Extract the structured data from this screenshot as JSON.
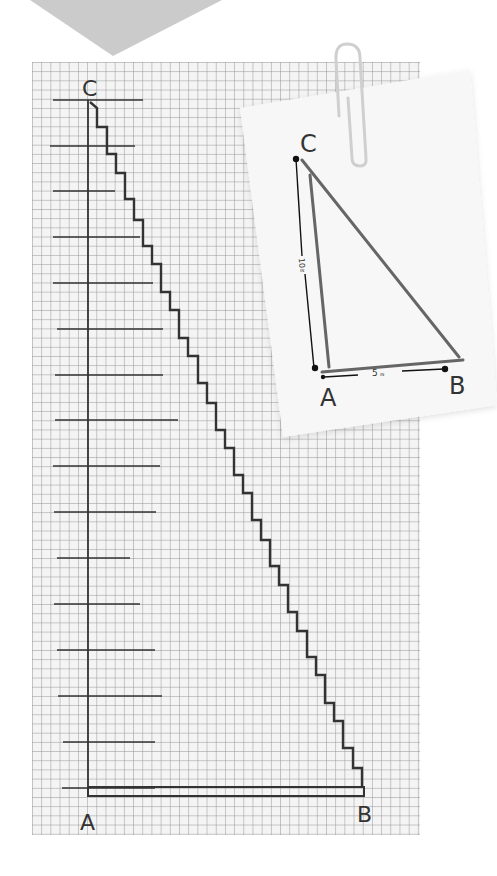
{
  "main_diagram": {
    "vertex_labels": {
      "top": "C",
      "bottom_left": "A",
      "bottom_right": "B"
    },
    "tick_count": 16,
    "step_count": 30
  },
  "note_card": {
    "vertex_labels": {
      "top": "C",
      "bottom_left": "A",
      "bottom_right": "B"
    },
    "side_ca_label": "10",
    "side_ca_unit": "IN",
    "side_ab_label": "5",
    "side_ab_unit": "IN"
  },
  "colors": {
    "chevron": "#cbcbcb",
    "grid_line": "#a0a0a0",
    "ink": "#333333",
    "card": "#f7f7f7",
    "paperclip": "#d8d8d8"
  }
}
